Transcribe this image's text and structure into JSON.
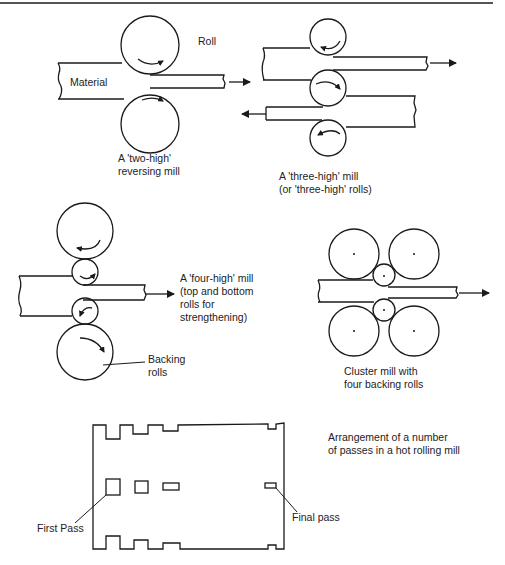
{
  "figure": {
    "two_high": {
      "roll_label": "Roll",
      "material_label": "Material",
      "caption_line1": "A 'two-high'",
      "caption_line2": "reversing mill"
    },
    "three_high": {
      "caption_line1": "A 'three-high' mill",
      "caption_line2": "(or 'three-high' rolls)"
    },
    "four_high": {
      "caption_line1": "A 'four-high' mill",
      "caption_line2": "(top and bottom",
      "caption_line3": "rolls for",
      "caption_line4": "strengthening)",
      "backing_label_line1": "Backing",
      "backing_label_line2": "rolls"
    },
    "cluster": {
      "caption_line1": "Cluster mill with",
      "caption_line2": "four backing rolls"
    },
    "passes": {
      "caption_line1": "Arrangement of a number",
      "caption_line2": "of passes in a hot rolling mill",
      "first_pass_label": "First Pass",
      "final_pass_label": "Final pass"
    }
  },
  "colors": {
    "line": "#1a1a1a",
    "background": "#ffffff",
    "rule": "#555555"
  }
}
